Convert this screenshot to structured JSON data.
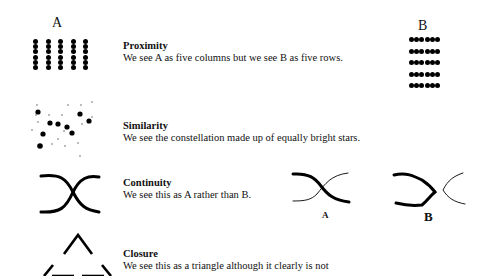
{
  "principles": [
    {
      "id": "proximity",
      "title": "Proximity",
      "description": "We see A as five columns but we see B as five rows.",
      "figures": [
        {
          "label": "A",
          "arrangement": "5 columns x 6 dots, tightly spaced vertically"
        },
        {
          "label": "B",
          "arrangement": "5 rows x 6 dots, tightly spaced horizontally"
        }
      ]
    },
    {
      "id": "similarity",
      "title": "Similarity",
      "description": "We see the constellation made up of equally bright stars.",
      "figures": [
        {
          "label": "",
          "arrangement": "scattered large and small dots"
        }
      ]
    },
    {
      "id": "continuity",
      "title": "Continuity",
      "description": "We see this as A rather than B.",
      "figures": [
        {
          "label": "",
          "arrangement": "two crossing curves"
        },
        {
          "label": "A",
          "arrangement": "crossing thick and thin curves"
        },
        {
          "label": "B",
          "arrangement": "thick bracket and thin bracket, not crossing"
        }
      ]
    },
    {
      "id": "closure",
      "title": "Closure",
      "description": "We see this as a triangle although it clearly is not",
      "figures": [
        {
          "label": "",
          "arrangement": "triangle with gaps at the corners"
        }
      ]
    }
  ],
  "labels": {
    "proximity_a": "A",
    "proximity_b": "B",
    "continuity_a": "A",
    "continuity_b": "B"
  }
}
